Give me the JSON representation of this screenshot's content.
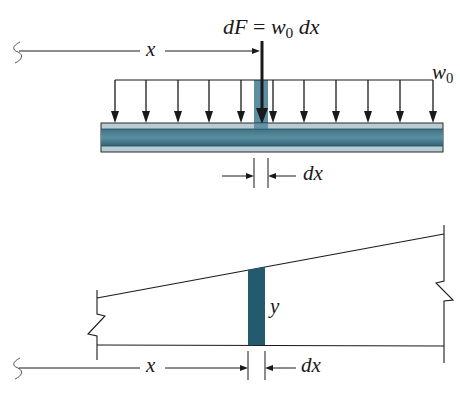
{
  "figure": {
    "top_panel": {
      "force_label": {
        "lhs": "dF",
        "equals": "=",
        "w": "w",
        "w_sub": "0",
        "rhs": "dx"
      },
      "distance_label": "x",
      "load_label": {
        "w": "w",
        "w_sub": "0"
      },
      "width_label": "dx"
    },
    "bottom_panel": {
      "height_label": "y",
      "distance_label": "x",
      "width_label": "dx"
    },
    "colors": {
      "line": "#1a1a1a",
      "beam_dark": "#2f6478",
      "beam_light": "#9fb8c2",
      "strip": "#245a6e",
      "background": "#ffffff"
    }
  }
}
